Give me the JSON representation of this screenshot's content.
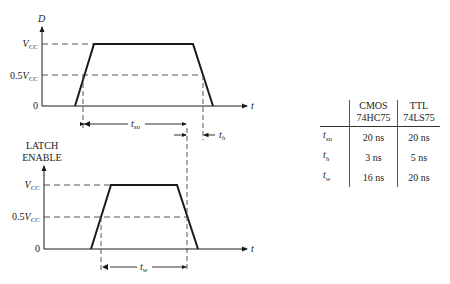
{
  "diagram": {
    "top": {
      "axis_label": "D",
      "time_label": "t",
      "levels": {
        "vcc": "V",
        "vcc_sub": "CC",
        "half_prefix": "0.5",
        "zero": "0"
      },
      "intervals": {
        "setup": {
          "label": "t",
          "sub": "su"
        },
        "hold": {
          "label": "t",
          "sub": "h"
        }
      }
    },
    "bottom": {
      "axis_label_line1": "LATCH",
      "axis_label_line2": "ENABLE",
      "time_label": "t",
      "levels": {
        "vcc": "V",
        "vcc_sub": "CC",
        "half_prefix": "0.5",
        "zero": "0"
      },
      "intervals": {
        "width": {
          "label": "t",
          "sub": "w"
        }
      }
    }
  },
  "table": {
    "headers": [
      {
        "line1": "",
        "line2": ""
      },
      {
        "line1": "CMOS",
        "line2": "74HC75"
      },
      {
        "line1": "TTL",
        "line2": "74LS75"
      }
    ],
    "rows": [
      {
        "param": "t",
        "param_sub": "su",
        "cmos": "20 ns",
        "ttl": "20 ns"
      },
      {
        "param": "t",
        "param_sub": "h",
        "cmos": "3 ns",
        "ttl": "5 ns"
      },
      {
        "param": "t",
        "param_sub": "w",
        "cmos": "16 ns",
        "ttl": "20 ns"
      }
    ]
  },
  "colors": {
    "line": "#1a1a1a",
    "dash": "#444444"
  }
}
